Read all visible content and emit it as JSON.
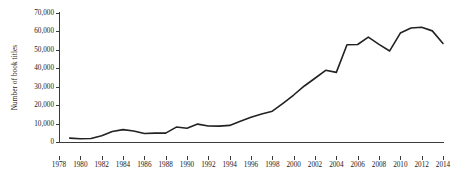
{
  "chart_data": {
    "type": "line",
    "title": "",
    "xlabel": "",
    "ylabel": "Number of book titles",
    "xlim": [
      1978,
      2014
    ],
    "ylim": [
      0,
      70000
    ],
    "grid": false,
    "legend": null,
    "xticks": [
      1978,
      1980,
      1982,
      1984,
      1986,
      1988,
      1990,
      1992,
      1994,
      1996,
      1998,
      2000,
      2002,
      2004,
      2006,
      2008,
      2010,
      2012,
      2014
    ],
    "xtick_labels": [
      "1978",
      "1980",
      "1982",
      "1984",
      "1986",
      "1988",
      "1990",
      "1992",
      "1994",
      "1996",
      "1998",
      "2000",
      "2002",
      "2004",
      "2006",
      "2008",
      "2010",
      "2012",
      "2014"
    ],
    "yticks": [
      0,
      10000,
      20000,
      30000,
      40000,
      50000,
      60000,
      70000
    ],
    "ytick_labels": [
      "0",
      "10,000",
      "20,000",
      "30,000",
      "40,000",
      "50,000",
      "60,000",
      "70,000"
    ],
    "series": [
      {
        "name": "Number of book titles",
        "color": "#222222",
        "line_width": 1.6,
        "x": [
          1979,
          1980,
          1981,
          1982,
          1983,
          1984,
          1985,
          1986,
          1987,
          1988,
          1989,
          1990,
          1991,
          1992,
          1993,
          1994,
          1995,
          1996,
          1997,
          1998,
          1999,
          2000,
          2001,
          2002,
          2003,
          2004,
          2005,
          2006,
          2007,
          2008,
          2009,
          2010,
          2011,
          2012,
          2013,
          2014
        ],
        "values": [
          2100,
          1800,
          1900,
          3400,
          5700,
          6700,
          6000,
          4600,
          4800,
          4800,
          8100,
          7500,
          9700,
          8700,
          8600,
          9000,
          11200,
          13400,
          15200,
          16700,
          21000,
          25500,
          30400,
          34600,
          38900,
          37800,
          52800,
          52900,
          56900,
          53000,
          49400,
          59100,
          61900,
          62300,
          60300,
          53500
        ]
      }
    ]
  }
}
